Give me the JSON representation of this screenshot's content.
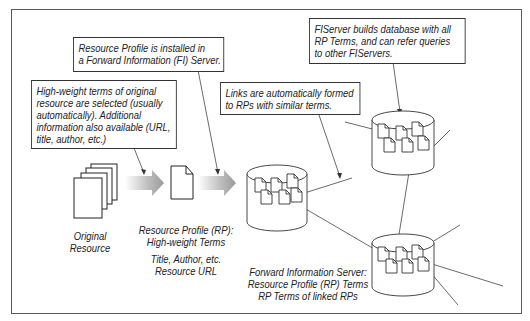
{
  "notes": {
    "fi_install": {
      "lines": [
        "Resource Profile is installed in",
        "a Forward Information (FI) Server."
      ]
    },
    "high_weight": {
      "lines": [
        "High-weight terms of original",
        "resource are selected (usually",
        "automatically).  Additional",
        "information also available (URL,",
        "title, author, etc.)"
      ]
    },
    "links": {
      "lines": [
        "Links are automatically formed",
        "to RPs with similar terms."
      ]
    },
    "fiserver_db": {
      "lines": [
        "FIServer builds database with all",
        "RP Terms, and can refer queries",
        "to other FIServers."
      ]
    }
  },
  "labels": {
    "original_resource": [
      "Original",
      "Resource"
    ],
    "resource_profile": [
      "Resource Profile (RP):",
      "High-weight Terms"
    ],
    "resource_profile_extra": [
      "Title, Author, etc.",
      "Resource URL"
    ],
    "fi_server": [
      "Forward Information Server:",
      "Resource Profile (RP) Terms",
      "RP Terms of linked RPs"
    ]
  },
  "icons": {
    "original_resource": "document-stack-icon",
    "resource_profile": "document-icon",
    "fi_server": "database-cylinder-icon",
    "flow_arrow": "gradient-arrow-icon"
  }
}
